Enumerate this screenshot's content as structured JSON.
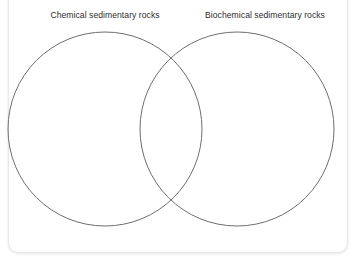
{
  "diagram": {
    "type": "venn",
    "set_count": 2,
    "labels": {
      "left": "Chemical sedimentary rocks",
      "right": "Biochemical sedimentary rocks"
    },
    "regions": {
      "left_only": "",
      "intersection": "",
      "right_only": ""
    },
    "geometry": {
      "left_circle": {
        "cx": 105,
        "cy": 129,
        "r": 97
      },
      "right_circle": {
        "cx": 237,
        "cy": 129,
        "r": 97
      }
    },
    "colors": {
      "stroke": "#6e6e6e",
      "fill": "#ffffff",
      "label_text": "#2d2d2d",
      "card_background": "#ffffff",
      "card_border": "#e9e9ea"
    }
  }
}
